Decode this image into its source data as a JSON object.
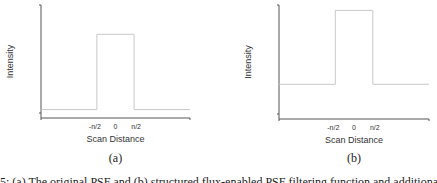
{
  "chart_data": [
    {
      "type": "line",
      "panel_label": "(a)",
      "xlabel": "Scan Distance",
      "ylabel": "Intensity",
      "x_ticks": [
        "-n/2",
        "0",
        "n/2"
      ],
      "x": [
        -2.0,
        -0.5,
        -0.5,
        0.5,
        0.5,
        2.0
      ],
      "series": [
        {
          "name": "original PSF",
          "values": [
            0.1,
            0.1,
            1.0,
            1.0,
            0.1,
            0.1
          ]
        }
      ],
      "xlim": [
        -2.0,
        2.0
      ],
      "ylim": [
        0,
        1.35
      ],
      "grid": false,
      "line_color": "#c8c8c8"
    },
    {
      "type": "line",
      "panel_label": "(b)",
      "xlabel": "Scan Distance",
      "ylabel": "Intensity",
      "x_ticks": [
        "-n/2",
        "0",
        "n/2"
      ],
      "x": [
        -2.0,
        -0.5,
        -0.5,
        0.5,
        0.5,
        2.0
      ],
      "series": [
        {
          "name": "modified PSF",
          "values": [
            0.32,
            0.32,
            1.0,
            1.0,
            0.32,
            0.32
          ]
        }
      ],
      "xlim": [
        -2.0,
        2.0
      ],
      "ylim": [
        0,
        1.05
      ],
      "grid": false,
      "line_color": "#c8c8c8"
    }
  ],
  "caption": "5: (a) The original PSF and (b) structured flux-enabled PSF filtering function and additional"
}
